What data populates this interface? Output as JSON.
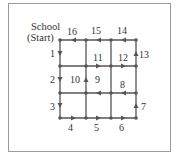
{
  "diagram": {
    "start_label_line1": "School",
    "start_label_line2": "(Start)",
    "colors": {
      "line": "#555555",
      "frame": "#9a9a9a",
      "text": "#333333"
    },
    "grid": {
      "columns_x": [
        60,
        86,
        111,
        136
      ],
      "rows_y": [
        40,
        66,
        93,
        118
      ]
    },
    "segments": [
      {
        "label": "1",
        "from": [
          60,
          40
        ],
        "to": [
          60,
          66
        ],
        "direction": "down"
      },
      {
        "label": "2",
        "from": [
          60,
          66
        ],
        "to": [
          60,
          93
        ],
        "direction": "down"
      },
      {
        "label": "3",
        "from": [
          60,
          93
        ],
        "to": [
          60,
          118
        ],
        "direction": "down"
      },
      {
        "label": "4",
        "from": [
          60,
          118
        ],
        "to": [
          86,
          118
        ],
        "direction": "right"
      },
      {
        "label": "5",
        "from": [
          86,
          118
        ],
        "to": [
          111,
          118
        ],
        "direction": "right"
      },
      {
        "label": "6",
        "from": [
          111,
          118
        ],
        "to": [
          136,
          118
        ],
        "direction": "right"
      },
      {
        "label": "7",
        "from": [
          136,
          118
        ],
        "to": [
          136,
          93
        ],
        "direction": "up"
      },
      {
        "label": "8",
        "from": [
          136,
          93
        ],
        "to": [
          111,
          93
        ],
        "direction": "left"
      },
      {
        "label": "9",
        "from": [
          111,
          93
        ],
        "to": [
          86,
          93
        ],
        "direction": "left"
      },
      {
        "label": "10",
        "from": [
          86,
          93
        ],
        "to": [
          86,
          66
        ],
        "direction": "up"
      },
      {
        "label": "11",
        "from": [
          86,
          66
        ],
        "to": [
          111,
          66
        ],
        "direction": "right"
      },
      {
        "label": "12",
        "from": [
          111,
          66
        ],
        "to": [
          136,
          66
        ],
        "direction": "right"
      },
      {
        "label": "13",
        "from": [
          136,
          66
        ],
        "to": [
          136,
          40
        ],
        "direction": "up"
      },
      {
        "label": "14",
        "from": [
          136,
          40
        ],
        "to": [
          111,
          40
        ],
        "direction": "left"
      },
      {
        "label": "15",
        "from": [
          111,
          40
        ],
        "to": [
          86,
          40
        ],
        "direction": "left"
      },
      {
        "label": "16",
        "from": [
          86,
          40
        ],
        "to": [
          60,
          40
        ],
        "direction": "left"
      }
    ]
  }
}
